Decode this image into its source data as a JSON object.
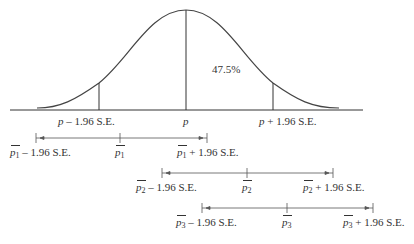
{
  "diagram": {
    "type": "normal-distribution-confidence-intervals",
    "curve": {
      "center_label": "p",
      "left_label_var": "p",
      "left_label_rest": " – 1.96 S.E.",
      "right_label_var": "p",
      "right_label_rest": " + 1.96 S.E.",
      "area_label": "47.5%"
    },
    "intervals": [
      {
        "var": "p",
        "sub": "1",
        "lower_rest": " – 1.96 S.E.",
        "upper_rest": " + 1.96 S.E."
      },
      {
        "var": "p",
        "sub": "2",
        "lower_rest": " – 1.96 S.E.",
        "upper_rest": " + 1.96 S.E."
      },
      {
        "var": "p",
        "sub": "3",
        "lower_rest": " – 1.96 S.E.",
        "upper_rest": " + 1.96 S.E."
      }
    ],
    "colors": {
      "stroke": "#333333",
      "interval_stroke": "#555555"
    }
  }
}
